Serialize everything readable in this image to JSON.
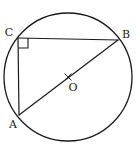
{
  "figure": {
    "type": "geometry-diagram",
    "canvas": {
      "width": 137,
      "height": 149
    },
    "background_color": "#ffffff",
    "stroke_color": "#1a1a1a",
    "stroke_width": 1.2
  },
  "circle": {
    "name": "circumscribed-circle",
    "center": {
      "x": 68,
      "y": 77
    },
    "radius": 64,
    "fill": "none"
  },
  "points": [
    {
      "id": "C",
      "label": "C",
      "x": 18,
      "y": 38,
      "label_x": 9,
      "label_y": 32
    },
    {
      "id": "B",
      "label": "B",
      "x": 118,
      "y": 40,
      "label_x": 126,
      "label_y": 34
    },
    {
      "id": "A",
      "label": "A",
      "x": 19,
      "y": 115,
      "label_x": 13,
      "label_y": 124
    },
    {
      "id": "O",
      "label": "O",
      "x": 68,
      "y": 77,
      "label_x": 73,
      "label_y": 87
    }
  ],
  "segments": [
    {
      "id": "CB",
      "from": "C",
      "to": "B",
      "x1": 18,
      "y1": 38,
      "x2": 118,
      "y2": 40
    },
    {
      "id": "CA",
      "from": "C",
      "to": "A",
      "x1": 18,
      "y1": 38,
      "x2": 19,
      "y2": 115
    },
    {
      "id": "AB",
      "from": "A",
      "to": "B",
      "x1": 19,
      "y1": 115,
      "x2": 118,
      "y2": 40
    }
  ],
  "markers": {
    "right_angle": {
      "at_point": "C",
      "label": "right-angle-marker",
      "size": 10,
      "path": "M 18 48 L 28 48 L 28 38"
    },
    "center_tick": {
      "at_point": "O",
      "label": "center-tick-marker",
      "path": "M 65 74 L 71 80 M 71 74 L 65 80"
    }
  },
  "labels": {
    "C": "C",
    "B": "B",
    "A": "A",
    "O": "O"
  }
}
